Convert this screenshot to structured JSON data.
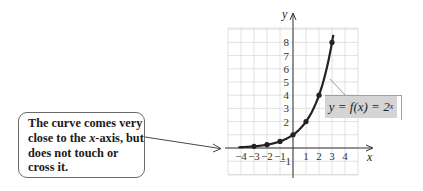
{
  "chart_data": {
    "type": "line",
    "title": "",
    "function_label": "y = f(x) = 2^x",
    "xlabel": "x",
    "ylabel": "y",
    "xlim": [
      -5,
      5
    ],
    "ylim": [
      -2,
      9
    ],
    "grid": true,
    "x_ticks": [
      -4,
      -3,
      -2,
      -1,
      1,
      2,
      3,
      4
    ],
    "x_tick_labels": [
      "−4",
      "−3",
      "−2",
      "−1",
      "1",
      "2",
      "3",
      "4"
    ],
    "y_ticks": [
      -1,
      2,
      3,
      4,
      5,
      6,
      7,
      8
    ],
    "y_tick_labels": [
      "−1",
      "2",
      "3",
      "4",
      "5",
      "6",
      "7",
      "8"
    ],
    "series": [
      {
        "name": "y = 2^x",
        "points": [
          {
            "x": -3,
            "y": 0.125
          },
          {
            "x": -2,
            "y": 0.25
          },
          {
            "x": -1,
            "y": 0.5
          },
          {
            "x": 0,
            "y": 1
          },
          {
            "x": 1,
            "y": 2
          },
          {
            "x": 2,
            "y": 4
          },
          {
            "x": 3,
            "y": 8
          }
        ]
      }
    ],
    "annotations": [
      "The curve comes very close to the x-axis, but does not touch or cross it."
    ]
  },
  "callout": {
    "lines": [
      "The curve comes very",
      "close to the ",
      "x",
      "-axis, but",
      "does not touch or",
      "cross it."
    ]
  },
  "equation": {
    "lhs": "y = f(x) = 2",
    "exponent": "x"
  },
  "axes": {
    "x_label": "x",
    "y_label": "y"
  },
  "colors": {
    "curve": "#222222",
    "grid": "#d9d9d9",
    "axis": "#333333",
    "label_box": "#d4d4d4"
  }
}
